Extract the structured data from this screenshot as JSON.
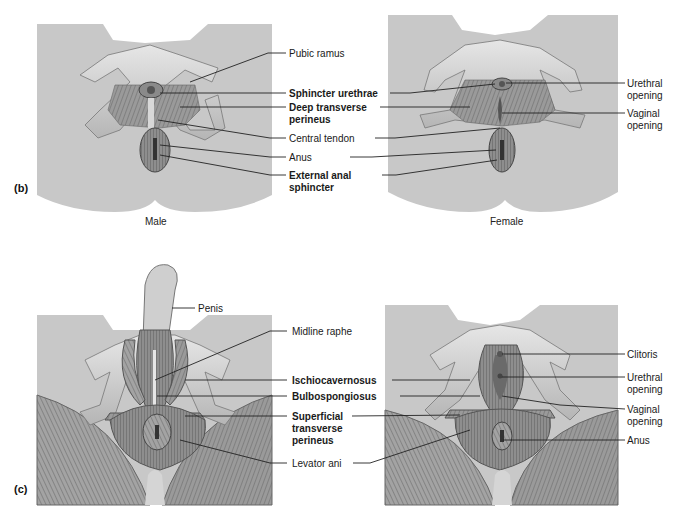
{
  "figure": {
    "panel_b": {
      "tag": "(b)",
      "male_caption": "Male",
      "female_caption": "Female",
      "center_labels": {
        "pubic_ramus": "Pubic ramus",
        "sphincter_urethrae": "Sphincter urethrae",
        "deep_transverse_1": "Deep transverse",
        "deep_transverse_2": "perineus",
        "central_tendon": "Central tendon",
        "anus": "Anus",
        "external_anal_1": "External anal",
        "external_anal_2": "sphincter"
      },
      "right_labels": {
        "urethral_1": "Urethral",
        "urethral_2": "opening",
        "vaginal_1": "Vaginal",
        "vaginal_2": "opening"
      }
    },
    "panel_c": {
      "tag": "(c)",
      "penis": "Penis",
      "center_labels": {
        "midline_raphe": "Midline raphe",
        "ischiocavernosus": "Ischiocavernosus",
        "bulbospongiosus": "Bulbospongiosus",
        "superficial_1": "Superficial",
        "superficial_2": "transverse",
        "superficial_3": "perineus",
        "levator_ani": "Levator ani"
      },
      "right_labels": {
        "clitoris": "Clitoris",
        "urethral_1": "Urethral",
        "urethral_2": "opening",
        "vaginal_1": "Vaginal",
        "vaginal_2": "opening",
        "anus": "Anus"
      }
    },
    "colors": {
      "skin": "#c9c9c9",
      "muscle": "#8f8f8f",
      "bone": "#dcdcdc",
      "line": "#222222"
    }
  }
}
